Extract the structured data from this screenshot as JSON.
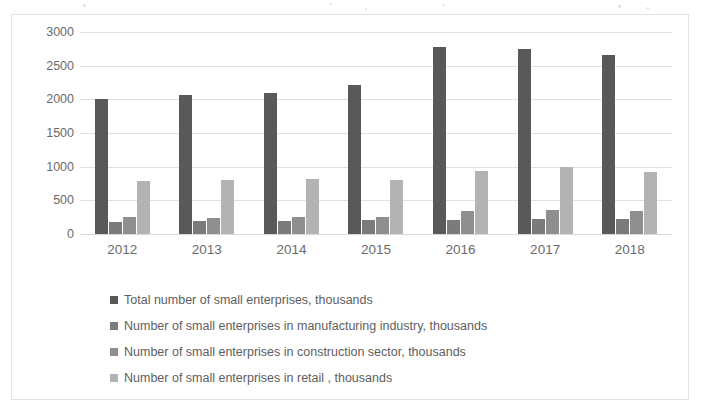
{
  "chart_data": {
    "type": "bar",
    "title": "",
    "subtitle": "",
    "xlabel": "",
    "ylabel": "",
    "categories": [
      "2012",
      "2013",
      "2014",
      "2015",
      "2016",
      "2017",
      "2018"
    ],
    "series": [
      {
        "name": "Total number of small enterprises,  thousands",
        "color": "#595959",
        "values": [
          2000,
          2065,
          2100,
          2220,
          2780,
          2755,
          2660
        ]
      },
      {
        "name": "Number of small enterprises in manufacturing industry, thousands",
        "color": "#7b7b7b",
        "values": [
          180,
          190,
          195,
          205,
          210,
          220,
          225
        ]
      },
      {
        "name": "Number of small enterprises in construction sector,  thousands",
        "color": "#8f8f8f",
        "values": [
          250,
          235,
          255,
          255,
          340,
          350,
          340
        ]
      },
      {
        "name": "Number of small enterprises in retail , thousands",
        "color": "#b3b3b3",
        "values": [
          780,
          800,
          810,
          800,
          930,
          1000,
          920
        ]
      }
    ],
    "ylim": [
      0,
      3000
    ],
    "ytick_step": 500,
    "yticks": [
      "3000",
      "2500",
      "2000",
      "1500",
      "1000",
      "500",
      "0"
    ],
    "grid": true,
    "legend_position": "bottom-left"
  },
  "legend": {
    "entries": [
      {
        "label": "Total number of small enterprises,  thousands"
      },
      {
        "label": "Number of small enterprises in manufacturing industry, thousands"
      },
      {
        "label": "Number of small enterprises in construction sector,  thousands"
      },
      {
        "label": "Number of small enterprises in retail , thousands"
      }
    ]
  }
}
